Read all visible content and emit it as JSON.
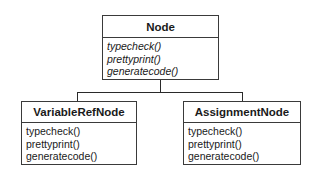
{
  "diagram": {
    "type": "uml-class-hierarchy",
    "classes": [
      {
        "name": "Node",
        "abstract": true,
        "operations": [
          "typecheck()",
          "prettyprint()",
          "generatecode()"
        ]
      },
      {
        "name": "VariableRefNode",
        "abstract": false,
        "operations": [
          "typecheck()",
          "prettyprint()",
          "generatecode()"
        ]
      },
      {
        "name": "AssignmentNode",
        "abstract": false,
        "operations": [
          "typecheck()",
          "prettyprint()",
          "generatecode()"
        ]
      }
    ],
    "relationships": [
      {
        "type": "inheritance",
        "child": "VariableRefNode",
        "parent": "Node"
      },
      {
        "type": "inheritance",
        "child": "AssignmentNode",
        "parent": "Node"
      }
    ]
  }
}
